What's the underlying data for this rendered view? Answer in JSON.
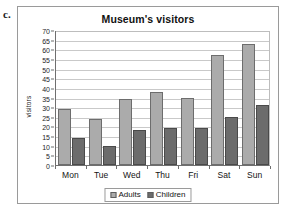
{
  "item_letter": "c.",
  "chart_data": {
    "type": "bar",
    "title": "Museum's visitors",
    "xlabel": "",
    "ylabel": "visitors",
    "categories": [
      "Mon",
      "Tue",
      "Wed",
      "Thu",
      "Fri",
      "Sat",
      "Sun"
    ],
    "series": [
      {
        "name": "Adults",
        "color": "#ababab",
        "values": [
          29,
          24,
          34,
          38,
          35,
          57,
          63
        ]
      },
      {
        "name": "Children",
        "color": "#6c6c6c",
        "values": [
          14,
          10,
          18,
          19,
          19,
          25,
          31
        ]
      }
    ],
    "ylim": [
      0,
      70
    ],
    "ytick_step": 5,
    "yticks": [
      0,
      5,
      10,
      15,
      20,
      25,
      30,
      35,
      40,
      45,
      50,
      55,
      60,
      65,
      70
    ],
    "grid": true,
    "legend_position": "bottom"
  }
}
